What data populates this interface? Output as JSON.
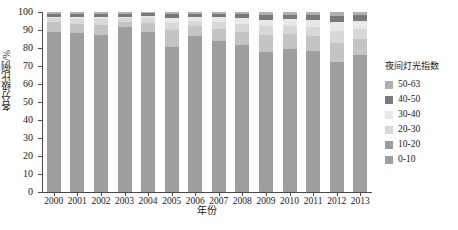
{
  "chart_data": {
    "type": "bar",
    "stacked": true,
    "title": "",
    "xlabel": "年份",
    "ylabel": "各分级比例/%",
    "ylim": [
      0,
      100
    ],
    "yticks": [
      0,
      10,
      20,
      30,
      40,
      50,
      60,
      70,
      80,
      90,
      100
    ],
    "grid": false,
    "legend_position": "right",
    "legend_title": "夜间灯光指数",
    "categories": [
      "2000",
      "2001",
      "2002",
      "2003",
      "2004",
      "2005",
      "2006",
      "2007",
      "2008",
      "2009",
      "2010",
      "2011",
      "2012",
      "2013"
    ],
    "series": [
      {
        "name": "0-10",
        "color": "#9e9e9e",
        "values": [
          89.0,
          88.5,
          87.5,
          91.5,
          89.0,
          80.5,
          86.5,
          84.0,
          81.5,
          78.0,
          79.5,
          78.5,
          72.5,
          76.0
        ]
      },
      {
        "name": "10-20",
        "color": "#c4c4c4",
        "values": [
          5.5,
          5.0,
          5.5,
          3.0,
          5.0,
          9.5,
          5.5,
          6.5,
          7.5,
          9.0,
          8.5,
          8.0,
          10.5,
          9.0
        ]
      },
      {
        "name": "20-30",
        "color": "#d8d8d8",
        "values": [
          2.0,
          2.5,
          3.0,
          2.0,
          2.5,
          4.0,
          3.0,
          4.0,
          4.5,
          5.0,
          4.5,
          5.0,
          6.5,
          5.5
        ]
      },
      {
        "name": "30-40",
        "color": "#e8e8e8",
        "values": [
          1.0,
          1.5,
          1.5,
          1.0,
          1.5,
          2.5,
          2.0,
          2.5,
          3.0,
          3.5,
          3.5,
          4.0,
          5.0,
          4.5
        ]
      },
      {
        "name": "40-50",
        "color": "#7a7a7a",
        "values": [
          1.5,
          1.5,
          1.5,
          1.5,
          1.5,
          2.5,
          2.0,
          2.0,
          2.5,
          3.0,
          2.5,
          3.0,
          3.5,
          3.5
        ]
      },
      {
        "name": "50-63",
        "color": "#b0b0b0",
        "values": [
          1.0,
          1.0,
          1.0,
          1.0,
          0.5,
          1.0,
          1.0,
          1.0,
          1.0,
          1.5,
          1.5,
          1.5,
          2.0,
          1.5
        ]
      }
    ]
  },
  "legend": {
    "title": "夜间灯光指数",
    "items": [
      {
        "label": "50-63",
        "color": "#b0b0b0"
      },
      {
        "label": "40-50",
        "color": "#7a7a7a"
      },
      {
        "label": "30-40",
        "color": "#e8e8e8"
      },
      {
        "label": "20-30",
        "color": "#d8d8d8"
      },
      {
        "label": "10-20",
        "color": "#9b9b9b"
      },
      {
        "label": "0-10",
        "color": "#9e9e9e"
      }
    ]
  },
  "axes": {
    "x_title": "年份",
    "y_title": "各分级比例/%",
    "y_tick_labels": [
      "100",
      "90",
      "80",
      "70",
      "60",
      "50",
      "40",
      "30",
      "20",
      "10",
      "0"
    ],
    "x_tick_labels": [
      "2000",
      "2001",
      "2002",
      "2003",
      "2004",
      "2005",
      "2006",
      "2007",
      "2008",
      "2009",
      "2010",
      "2011",
      "2012",
      "2013"
    ]
  }
}
